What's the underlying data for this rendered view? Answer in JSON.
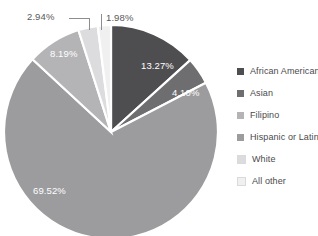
{
  "chart_data": {
    "type": "pie",
    "title": "",
    "title_remnant": "",
    "categories": [
      "African American",
      "Asian",
      "Hispanic or Latino",
      "Filipino",
      "White",
      "All other"
    ],
    "values": [
      13.27,
      4.1,
      69.52,
      8.19,
      2.94,
      1.98
    ],
    "value_labels": [
      "13.27%",
      "4.10%",
      "69.52%",
      "8.19%",
      "2.94%",
      "1.98%"
    ],
    "colors": [
      "#4e4e50",
      "#6e6e70",
      "#9c9c9e",
      "#b4b4b6",
      "#dcdcde",
      "#f0f0f0"
    ],
    "slice_order_clockwise_from_12": [
      "African American",
      "Asian",
      "Hispanic or Latino",
      "Filipino",
      "White",
      "All other"
    ],
    "label_placement": [
      "inside",
      "inside",
      "inside",
      "inside",
      "outside",
      "outside"
    ],
    "units": "percent",
    "total": 100,
    "legend_position": "right",
    "grid": false,
    "separator_color": "#ffffff",
    "background": "#ffffff"
  },
  "legend": {
    "items": [
      {
        "label": "African American",
        "color": "#4e4e50"
      },
      {
        "label": "Asian",
        "color": "#6e6e70"
      },
      {
        "label": "Filipino",
        "color": "#b4b4b6"
      },
      {
        "label": "Hispanic or Latino",
        "color": "#9c9c9e"
      },
      {
        "label": "White",
        "color": "#dcdcde"
      },
      {
        "label": "All other",
        "color": "#f0f0f0"
      }
    ]
  },
  "labels": {
    "african_american": "13.27%",
    "asian": "4.10%",
    "hispanic_or_latino": "69.52%",
    "filipino": "8.19%",
    "white": "2.94%",
    "all_other": "1.98%"
  }
}
